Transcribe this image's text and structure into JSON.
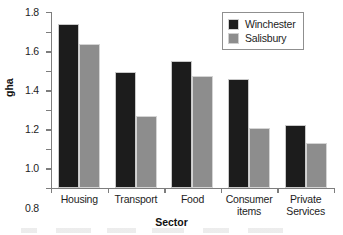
{
  "chart_data": {
    "type": "bar",
    "title": "",
    "xlabel": "Sector",
    "ylabel": "gha",
    "categories": [
      "Housing",
      "Transport",
      "Food",
      "Consumer items",
      "Private Services"
    ],
    "category_lines": [
      [
        "Housing"
      ],
      [
        "Transport"
      ],
      [
        "Food"
      ],
      [
        "Consumer",
        "items"
      ],
      [
        "Private",
        "Services"
      ]
    ],
    "series": [
      {
        "name": "Winchester",
        "color": "#1c1c1c",
        "values": [
          1.68,
          1.19,
          1.3,
          1.11,
          0.64
        ]
      },
      {
        "name": "Salisbury",
        "color": "#8d8d8d",
        "values": [
          1.47,
          0.74,
          1.15,
          0.61,
          0.46
        ]
      }
    ],
    "ylim": [
      0.0,
      1.8
    ],
    "ytick_step": 0.2,
    "yticks": [
      "0.0",
      "0.2",
      "0.4",
      "0.6",
      "0.8",
      "1.0",
      "1.2",
      "1.4",
      "1.6",
      "1.8"
    ],
    "grid": false,
    "legend_position": "top-right"
  }
}
